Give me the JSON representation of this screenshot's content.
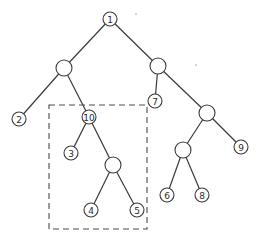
{
  "diagram": {
    "type": "binary-tree",
    "nodes": [
      {
        "id": "n1",
        "label": "1"
      },
      {
        "id": "a",
        "label": ""
      },
      {
        "id": "b",
        "label": ""
      },
      {
        "id": "n2",
        "label": "2"
      },
      {
        "id": "n10",
        "label": "10"
      },
      {
        "id": "n7",
        "label": "7"
      },
      {
        "id": "c",
        "label": ""
      },
      {
        "id": "n3",
        "label": "3"
      },
      {
        "id": "d",
        "label": ""
      },
      {
        "id": "e",
        "label": ""
      },
      {
        "id": "n9",
        "label": "9"
      },
      {
        "id": "n4",
        "label": "4"
      },
      {
        "id": "n5",
        "label": "5"
      },
      {
        "id": "n6",
        "label": "6"
      },
      {
        "id": "n8",
        "label": "8"
      }
    ],
    "edges": [
      [
        "n1",
        "a"
      ],
      [
        "n1",
        "b"
      ],
      [
        "a",
        "n2"
      ],
      [
        "a",
        "n10"
      ],
      [
        "b",
        "n7"
      ],
      [
        "b",
        "c"
      ],
      [
        "n10",
        "n3"
      ],
      [
        "n10",
        "d"
      ],
      [
        "c",
        "e"
      ],
      [
        "c",
        "n9"
      ],
      [
        "d",
        "n4"
      ],
      [
        "d",
        "n5"
      ],
      [
        "e",
        "n6"
      ],
      [
        "e",
        "n8"
      ]
    ],
    "highlighted_subtree": {
      "root": "n10",
      "style": "dashed-box"
    }
  }
}
